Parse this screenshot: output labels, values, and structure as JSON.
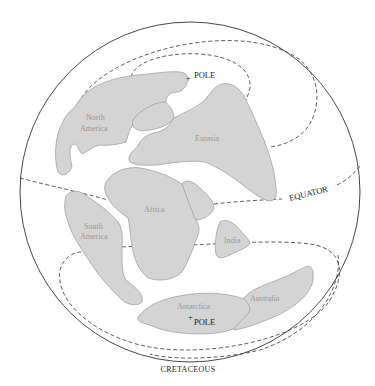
{
  "diagram": {
    "title": "CRETACEOUS",
    "type": "paleogeographic-globe",
    "continents": [
      {
        "name": "North America",
        "line1": "North",
        "line2": "America"
      },
      {
        "name": "Eurasia",
        "label": "Eurasia"
      },
      {
        "name": "Africa",
        "label": "Africa"
      },
      {
        "name": "South America",
        "line1": "South",
        "line2": "America"
      },
      {
        "name": "India",
        "label": "India"
      },
      {
        "name": "Antarctica",
        "label": "Antarctica"
      },
      {
        "name": "Australia",
        "label": "Australia"
      }
    ],
    "markers": {
      "north_pole": "POLE",
      "south_pole": "POLE",
      "equator": "EQUATOR"
    },
    "colors": {
      "land_fill": "#d4d4d4",
      "land_stroke": "#9a9a9a",
      "land_label": "#999999",
      "line": "#333333",
      "background": "#ffffff"
    }
  }
}
